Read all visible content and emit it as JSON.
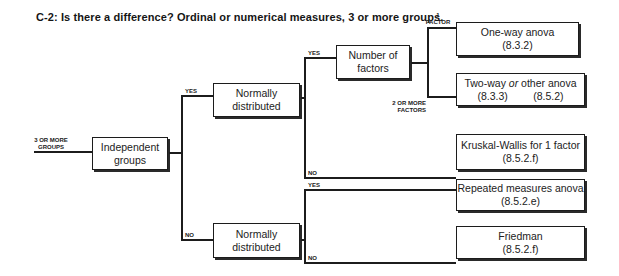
{
  "title": "C-2: Is there a difference? Ordinal or numerical measures, 3 or more groups.",
  "input_label": {
    "line1": "3 OR MORE",
    "line2": "GROUPS"
  },
  "nodes": {
    "independent_groups": {
      "line1": "Independent",
      "line2": "groups"
    },
    "normal_top": {
      "line1": "Normally",
      "line2": "distributed"
    },
    "normal_bottom": {
      "line1": "Normally",
      "line2": "distributed"
    },
    "number_of_factors": {
      "line1": "Number of",
      "line2": "factors"
    }
  },
  "edge_labels": {
    "yes_top": "YES",
    "no_bottom": "NO",
    "yes_factors": "YES",
    "no_kruskal": "NO",
    "one_factor": {
      "line1": "1",
      "line2": "FACTOR"
    },
    "two_factors": {
      "line1": "2 OR MORE",
      "line2": "FACTORS"
    },
    "yes_repeated": "YES",
    "no_friedman": "NO"
  },
  "outcomes": {
    "one_way": {
      "name": "One-way anova",
      "ref": "(8.3.2)"
    },
    "two_way": {
      "name_a": "Two-way ",
      "name_or": "or",
      "name_b": " other anova",
      "ref1": "(8.3.3)",
      "ref2": "(8.5.2)"
    },
    "kruskal": {
      "name": "Kruskal-Wallis for 1 factor",
      "ref": "(8.5.2.f)"
    },
    "repeated": {
      "name": "Repeated measures anova",
      "ref": "(8.5.2.e)"
    },
    "friedman": {
      "name": "Friedman",
      "ref": "(8.5.2.f)"
    }
  }
}
